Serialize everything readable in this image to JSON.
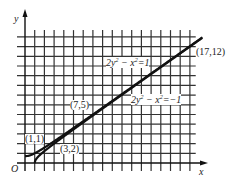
{
  "chart_data": {
    "type": "line",
    "title": "",
    "xlabel": "x",
    "ylabel": "y",
    "origin_label": "O",
    "grid": true,
    "xlim": [
      0,
      18
    ],
    "ylim": [
      0,
      14
    ],
    "curves": [
      {
        "name": "2y^2 - x^2 = 1",
        "label_parts": [
          "2y",
          "2",
          " − x",
          "2",
          "=1"
        ],
        "type": "hyperbola",
        "equation": "2y^2 - x^2 = 1"
      },
      {
        "name": "2y^2 - x^2 = -1",
        "label_parts": [
          "2y",
          "2",
          " − x",
          "2",
          "=−1"
        ],
        "type": "hyperbola",
        "equation": "2y^2 - x^2 = -1"
      }
    ],
    "points": [
      {
        "label": "(1,1)",
        "x": 1,
        "y": 1
      },
      {
        "label": "(3,2)",
        "x": 3,
        "y": 2
      },
      {
        "label": "(7,5)",
        "x": 7,
        "y": 5
      },
      {
        "label": "(17,12)",
        "x": 17,
        "y": 12
      }
    ]
  }
}
